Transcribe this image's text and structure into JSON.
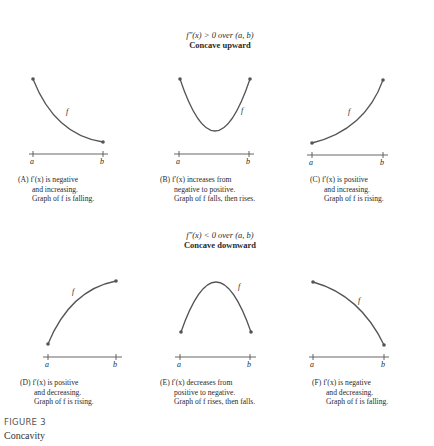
{
  "figure": {
    "label": "FIGURE 3",
    "title": "Concavity"
  },
  "sections": {
    "upward": {
      "condition": "f″(x) > 0 over (a, b)",
      "title": "Concave upward"
    },
    "downward": {
      "condition": "f″(x) < 0 over (a, b)",
      "title": "Concave downward"
    }
  },
  "panels": [
    {
      "id": "A",
      "curve_label": "f",
      "axis_labels": [
        "a",
        "b"
      ],
      "caption": [
        "(A)  f′(x) is negative",
        "and increasing.",
        "Graph of f is falling."
      ]
    },
    {
      "id": "B",
      "curve_label": "f",
      "axis_labels": [
        "a",
        "b"
      ],
      "caption": [
        "(B)  f′(x) increases from",
        "negative to positive.",
        "Graph of f falls, then rises."
      ]
    },
    {
      "id": "C",
      "curve_label": "f",
      "axis_labels": [
        "a",
        "b"
      ],
      "caption": [
        "(C)  f′(x) is positive",
        "and increasing.",
        "Graph of f is rising."
      ]
    },
    {
      "id": "D",
      "curve_label": "f",
      "axis_labels": [
        "a",
        "b"
      ],
      "caption": [
        "(D)  f′(x) is positive",
        "and decreasing.",
        "Graph of f is rising."
      ]
    },
    {
      "id": "E",
      "curve_label": "f",
      "axis_labels": [
        "a",
        "b"
      ],
      "caption": [
        "(E)  f′(x) decreases from",
        "positive to negative.",
        "Graph of f rises, then falls."
      ]
    },
    {
      "id": "F",
      "curve_label": "f",
      "axis_labels": [
        "a",
        "b"
      ],
      "caption": [
        "(F)  f′(x) is negative",
        "and decreasing.",
        "Graph of f is falling."
      ]
    }
  ],
  "colors": {
    "curve": "#555555",
    "axis": "#555555",
    "text": "#2a2a2a"
  }
}
